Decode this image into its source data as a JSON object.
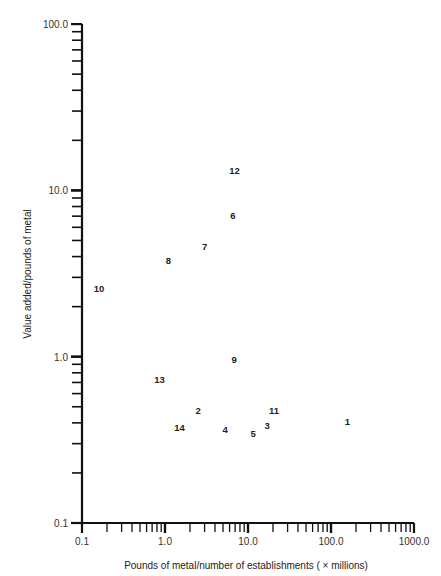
{
  "chart_data": {
    "type": "scatter",
    "title": "",
    "xlabel": "Pounds of metal/number of establishments ( × millions)",
    "ylabel": "Value added/pounds of metal",
    "xscale": "log",
    "yscale": "log",
    "xlim": [
      0.1,
      1000.0
    ],
    "ylim": [
      0.1,
      100.0
    ],
    "x_ticks": [
      "0.1",
      "1.0",
      "10.0",
      "100.0",
      "1000.0"
    ],
    "y_ticks": [
      "0.1",
      "1.0",
      "10.0",
      "100.0"
    ],
    "grid": false,
    "legend": null,
    "points": [
      {
        "label": "1",
        "x": 158,
        "y": 0.41
      },
      {
        "label": "2",
        "x": 2.5,
        "y": 0.48
      },
      {
        "label": "3",
        "x": 17,
        "y": 0.39
      },
      {
        "label": "4",
        "x": 5.3,
        "y": 0.37
      },
      {
        "label": "5",
        "x": 11.5,
        "y": 0.35
      },
      {
        "label": "6",
        "x": 6.6,
        "y": 7.1
      },
      {
        "label": "7",
        "x": 3.0,
        "y": 4.6
      },
      {
        "label": "8",
        "x": 1.1,
        "y": 3.8
      },
      {
        "label": "9",
        "x": 6.8,
        "y": 0.97
      },
      {
        "label": "10",
        "x": 0.16,
        "y": 2.6
      },
      {
        "label": "11",
        "x": 20.6,
        "y": 0.48
      },
      {
        "label": "12",
        "x": 6.9,
        "y": 13.3
      },
      {
        "label": "13",
        "x": 0.86,
        "y": 0.73
      },
      {
        "label": "14",
        "x": 1.5,
        "y": 0.38
      }
    ]
  }
}
